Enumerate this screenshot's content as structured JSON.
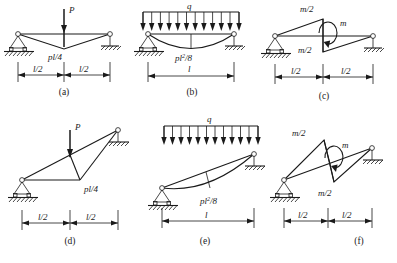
{
  "figure": {
    "line_color": "#1a1a1a",
    "background": "#ffffff"
  },
  "panels": [
    {
      "id": "a",
      "caption": "(a)",
      "orientation": "horizontal",
      "load_symbol": "P",
      "moment_label": "pl/4",
      "dimensions": [
        "l/2",
        "l/2"
      ],
      "supports": [
        "pin",
        "roller"
      ],
      "diagram_shape": "triangular"
    },
    {
      "id": "b",
      "caption": "(b)",
      "orientation": "horizontal",
      "load_symbol": "q",
      "moment_label": "pl",
      "moment_label_sup": "2",
      "moment_label_tail": "/8",
      "moment_label_full": "pl²/8",
      "dimensions": [
        "l"
      ],
      "supports": [
        "pin",
        "roller"
      ],
      "diagram_shape": "parabolic",
      "arrow_count": 12
    },
    {
      "id": "c",
      "caption": "(c)",
      "orientation": "horizontal",
      "load_symbol": "m",
      "moment_label_top": "m/2",
      "moment_label_bottom": "m/2",
      "dimensions": [
        "l/2",
        "l/2"
      ],
      "supports": [
        "pin",
        "roller"
      ],
      "diagram_shape": "double-triangular"
    },
    {
      "id": "d",
      "caption": "(d)",
      "orientation": "inclined",
      "load_symbol": "P",
      "moment_label": "pl/4",
      "dimensions": [
        "l/2",
        "l/2"
      ],
      "supports": [
        "pin",
        "roller"
      ],
      "diagram_shape": "triangular"
    },
    {
      "id": "e",
      "caption": "(e)",
      "orientation": "inclined",
      "load_symbol": "q",
      "moment_label": "pl",
      "moment_label_sup": "2",
      "moment_label_tail": "/8",
      "moment_label_full": "pl²/8",
      "dimensions": [
        "l"
      ],
      "supports": [
        "pin",
        "roller"
      ],
      "diagram_shape": "parabolic",
      "arrow_count": 12
    },
    {
      "id": "f",
      "caption": "(f)",
      "orientation": "inclined",
      "load_symbol": "m",
      "moment_label_top": "m/2",
      "moment_label_bottom": "m/2",
      "dimensions": [
        "l/2",
        "l/2"
      ],
      "supports": [
        "pin",
        "roller"
      ],
      "diagram_shape": "double-triangular"
    }
  ]
}
